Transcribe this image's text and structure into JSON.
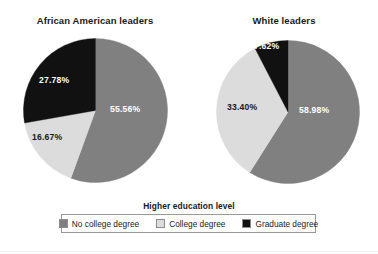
{
  "legend": {
    "title": "Higher education level",
    "items": [
      {
        "label": "No college degree",
        "color": "#808080",
        "key": "no_college_degree"
      },
      {
        "label": "College degree",
        "color": "#dcdcdc",
        "key": "college_degree"
      },
      {
        "label": "Graduate degree",
        "color": "#111111",
        "key": "graduate_degree"
      }
    ]
  },
  "charts": [
    {
      "title": "African American leaders",
      "labels": [
        "55.56%",
        "16.67%",
        "27.78%"
      ]
    },
    {
      "title": "White leaders",
      "labels": [
        "58.98%",
        "33.40%",
        "7.62%"
      ]
    }
  ],
  "chart_data": [
    {
      "type": "pie",
      "title": "African American leaders",
      "categories": [
        "No college degree",
        "College degree",
        "Graduate degree"
      ],
      "values": [
        55.56,
        16.67,
        27.78
      ],
      "data_labels": [
        "55.56%",
        "16.67%",
        "27.78%"
      ],
      "colors": [
        "#808080",
        "#dcdcdc",
        "#111111"
      ],
      "units": "percent",
      "total": 100.01,
      "start_angle_deg": 0,
      "direction": "clockwise",
      "legend_title": "Higher education level",
      "legend_position": "bottom",
      "grid": false
    },
    {
      "type": "pie",
      "title": "White leaders",
      "categories": [
        "No college degree",
        "College degree",
        "Graduate degree"
      ],
      "values": [
        58.98,
        33.4,
        7.62
      ],
      "data_labels": [
        "58.98%",
        "33.40%",
        "7.62%"
      ],
      "colors": [
        "#808080",
        "#dcdcdc",
        "#111111"
      ],
      "units": "percent",
      "total": 100.0,
      "start_angle_deg": 0,
      "direction": "clockwise",
      "legend_title": "Higher education level",
      "legend_position": "bottom",
      "grid": false
    }
  ]
}
